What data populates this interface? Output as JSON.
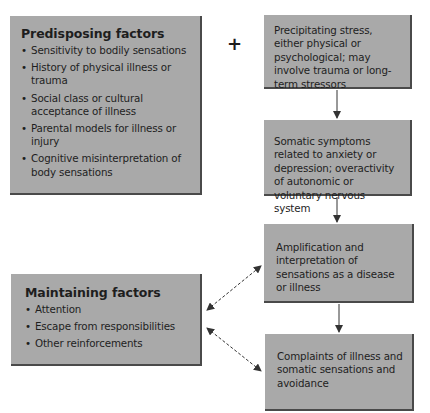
{
  "diagram": {
    "predisposing": {
      "title": "Predisposing factors",
      "items": [
        "Sensitivity to bodily sensations",
        "History of physical illness or trauma",
        "Social class or cultural acceptance of illness",
        "Parental models for illness or injury",
        "Cognitive misinterpretation of body sensations"
      ]
    },
    "plus_sign": "+",
    "steps": [
      "Precipitating stress, either physical or psychological; may involve trauma or long-term stressors",
      "Somatic symptoms related to anxiety or depression; overactivity of autonomic or voluntary nervous system",
      "Amplification and interpretation of sensations as a disease or illness",
      "Complaints of illness and somatic sensations and avoidance"
    ],
    "maintaining": {
      "title": "Maintaining factors",
      "items": [
        "Attention",
        "Escape from responsibilities",
        "Other reinforcements"
      ]
    },
    "colors": {
      "box_fill": "#a9a9a9",
      "box_shadow": "#4a4a4a",
      "arrow": "#333333"
    }
  }
}
